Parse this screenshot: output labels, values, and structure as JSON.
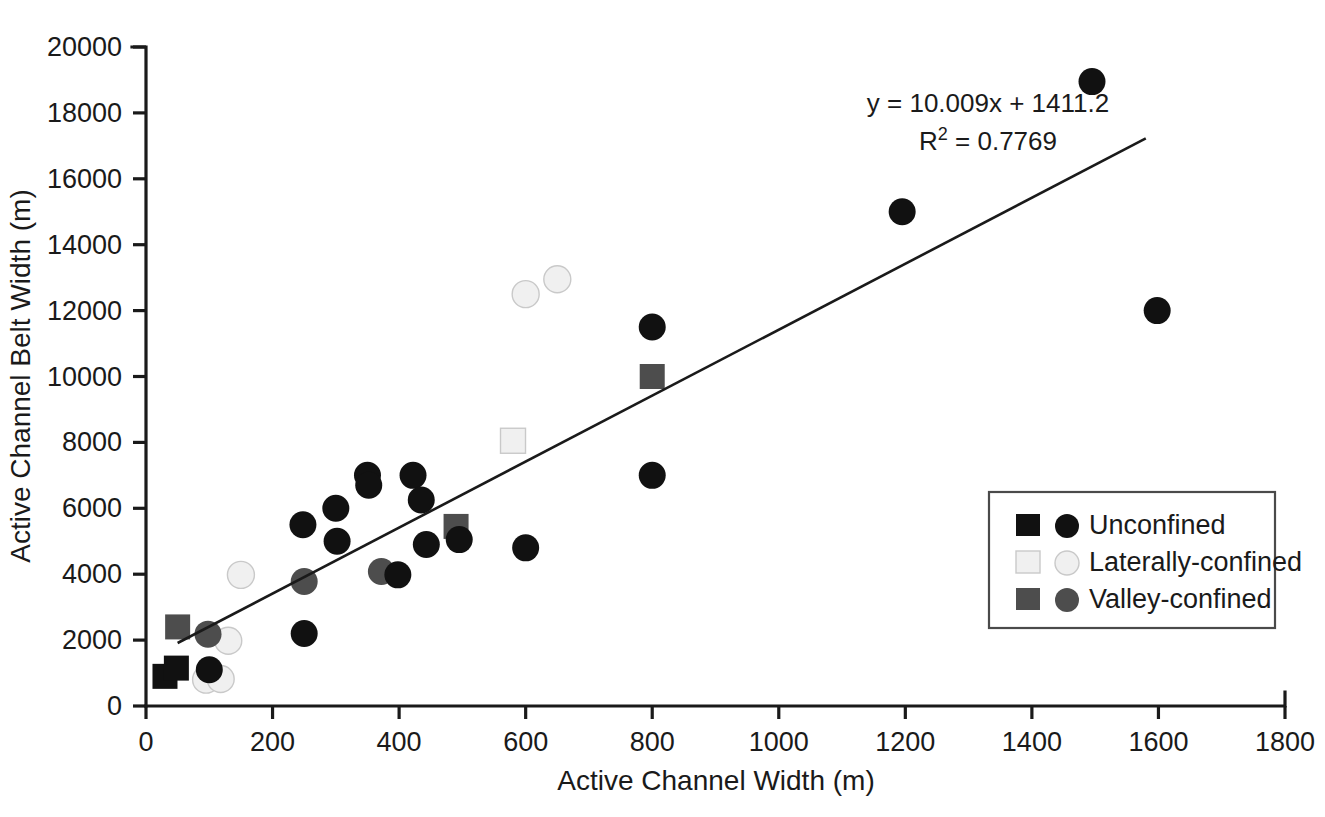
{
  "chart_data": {
    "type": "scatter",
    "title": "",
    "xlabel": "Active Channel Width (m)",
    "ylabel": "Active Channel Belt Width (m)",
    "xlim": [
      0,
      1800
    ],
    "ylim": [
      0,
      20000
    ],
    "xticks": [
      0,
      200,
      400,
      600,
      800,
      1000,
      1200,
      1400,
      1600,
      1800
    ],
    "yticks": [
      0,
      2000,
      4000,
      6000,
      8000,
      10000,
      12000,
      14000,
      16000,
      18000,
      20000
    ],
    "xtick_labels": [
      "0",
      "200",
      "400",
      "600",
      "800",
      "1000",
      "1200",
      "1400",
      "1600",
      "1800"
    ],
    "ytick_labels": [
      "0",
      "2000",
      "4000",
      "6000",
      "8000",
      "10000",
      "12000",
      "14000",
      "16000",
      "18000",
      "20000"
    ],
    "grid": false,
    "legend_position": "lower-right",
    "annotations": {
      "equation": "y = 10.009x + 1411.2",
      "r_squared_prefix": "R",
      "r_squared_exponent": "2",
      "r_squared_value": " = 0.7769"
    },
    "trendline": {
      "slope": 10.009,
      "intercept": 1411.2,
      "x_start": 50,
      "x_end": 1580,
      "color": "#1a1a1a"
    },
    "series": [
      {
        "name": "Unconfined",
        "color": "#111111",
        "marker_square": "square",
        "marker_circle": "circle",
        "points": [
          {
            "x": 30,
            "y": 900,
            "marker": "square"
          },
          {
            "x": 48,
            "y": 1150,
            "marker": "square"
          },
          {
            "x": 100,
            "y": 1100,
            "marker": "circle"
          },
          {
            "x": 250,
            "y": 2200,
            "marker": "circle"
          },
          {
            "x": 248,
            "y": 5500,
            "marker": "circle"
          },
          {
            "x": 300,
            "y": 6000,
            "marker": "circle"
          },
          {
            "x": 302,
            "y": 5000,
            "marker": "circle"
          },
          {
            "x": 350,
            "y": 7000,
            "marker": "circle"
          },
          {
            "x": 352,
            "y": 6700,
            "marker": "circle"
          },
          {
            "x": 398,
            "y": 3980,
            "marker": "circle"
          },
          {
            "x": 422,
            "y": 7000,
            "marker": "circle"
          },
          {
            "x": 435,
            "y": 6250,
            "marker": "circle"
          },
          {
            "x": 443,
            "y": 4900,
            "marker": "circle"
          },
          {
            "x": 495,
            "y": 5050,
            "marker": "circle"
          },
          {
            "x": 600,
            "y": 4800,
            "marker": "circle"
          },
          {
            "x": 800,
            "y": 11500,
            "marker": "circle"
          },
          {
            "x": 800,
            "y": 7000,
            "marker": "circle"
          },
          {
            "x": 1195,
            "y": 15000,
            "marker": "circle"
          },
          {
            "x": 1495,
            "y": 18950,
            "marker": "circle"
          },
          {
            "x": 1598,
            "y": 12000,
            "marker": "circle"
          }
        ]
      },
      {
        "name": "Laterally-confined",
        "color": "#f0f0f0",
        "marker_square": "square",
        "marker_circle": "circle",
        "points": [
          {
            "x": 95,
            "y": 800,
            "marker": "circle"
          },
          {
            "x": 118,
            "y": 820,
            "marker": "circle"
          },
          {
            "x": 130,
            "y": 1980,
            "marker": "circle"
          },
          {
            "x": 150,
            "y": 3980,
            "marker": "circle"
          },
          {
            "x": 580,
            "y": 8050,
            "marker": "square"
          },
          {
            "x": 600,
            "y": 12500,
            "marker": "circle"
          },
          {
            "x": 650,
            "y": 12950,
            "marker": "circle"
          }
        ]
      },
      {
        "name": "Valley-confined",
        "color": "#4d4d4d",
        "marker_square": "square",
        "marker_circle": "circle",
        "points": [
          {
            "x": 50,
            "y": 2400,
            "marker": "square"
          },
          {
            "x": 98,
            "y": 2180,
            "marker": "circle"
          },
          {
            "x": 250,
            "y": 3780,
            "marker": "circle"
          },
          {
            "x": 372,
            "y": 4080,
            "marker": "circle"
          },
          {
            "x": 490,
            "y": 5450,
            "marker": "square"
          },
          {
            "x": 800,
            "y": 10000,
            "marker": "square"
          }
        ]
      }
    ],
    "legend_entries": [
      {
        "label": "Unconfined",
        "color": "#111111"
      },
      {
        "label": "Laterally-confined",
        "color": "#f0f0f0"
      },
      {
        "label": "Valley-confined",
        "color": "#4d4d4d"
      }
    ]
  }
}
